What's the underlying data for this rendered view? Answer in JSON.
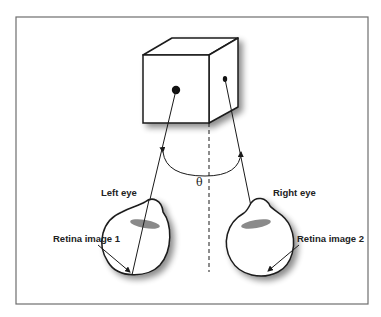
{
  "figure": {
    "labels": {
      "left_eye": "Left eye",
      "right_eye": "Right eye",
      "retina_1": "Retina image 1",
      "retina_2": "Retina image 2",
      "angle": "θ"
    },
    "elements": {
      "frame": "rectangular border",
      "cube": "3D cube with dot on front face and dot on right face",
      "center_line": "dashed vertical line",
      "angle_arc": "arc with arrowheads between sight lines"
    },
    "colors": {
      "stroke": "#1a1a1a",
      "frame": "#6e6e6e",
      "lens": "#8a8a8a",
      "shadow": "#9a9a9a"
    }
  }
}
